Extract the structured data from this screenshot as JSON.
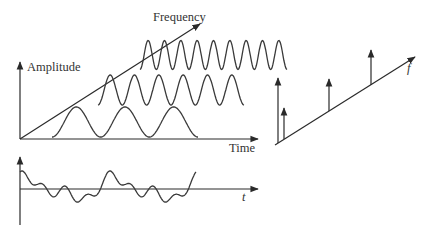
{
  "labels": {
    "frequency": "Frequency",
    "amplitude": "Amplitude",
    "time": "Time",
    "t": "t",
    "f": "f"
  },
  "colors": {
    "line": "#2a2a2a",
    "text": "#333333",
    "background": "#ffffff"
  },
  "time_domain_3d": {
    "origin": [
      20,
      139
    ],
    "amplitude_axis_top": [
      20,
      62
    ],
    "time_axis_end": [
      258,
      139
    ],
    "frequency_axis_end": [
      200,
      24
    ],
    "components": [
      {
        "name": "low-frequency-sine",
        "x_start": 52,
        "x_end": 198,
        "center_y": 122,
        "amplitude": 15,
        "cycles": 3,
        "phase": 0.25
      },
      {
        "name": "mid-frequency-sine",
        "x_start": 98,
        "x_end": 244,
        "center_y": 90,
        "amplitude": 15,
        "cycles": 6,
        "phase": 0.25
      },
      {
        "name": "high-frequency-sine",
        "x_start": 140,
        "x_end": 287,
        "center_y": 55,
        "amplitude": 14.5,
        "cycles": 9,
        "phase": 0.25
      }
    ]
  },
  "composite_signal": {
    "origin": [
      20,
      189
    ],
    "vertical_axis": [
      20,
      225,
      20,
      157
    ],
    "horizontal_axis_end": [
      258,
      189
    ],
    "x_start": 20,
    "x_end": 196,
    "description": "Sum of sinusoidal components"
  },
  "spectrum": {
    "axis_start": [
      277,
      143
    ],
    "axis_end": [
      415,
      57
    ],
    "amplitude_axis": [
      278,
      143,
      278,
      78
    ],
    "spikes": [
      {
        "x": 284,
        "base_y": 139,
        "top_y": 108
      },
      {
        "x": 329,
        "base_y": 111,
        "top_y": 79
      },
      {
        "x": 371,
        "base_y": 85,
        "top_y": 50
      }
    ]
  }
}
